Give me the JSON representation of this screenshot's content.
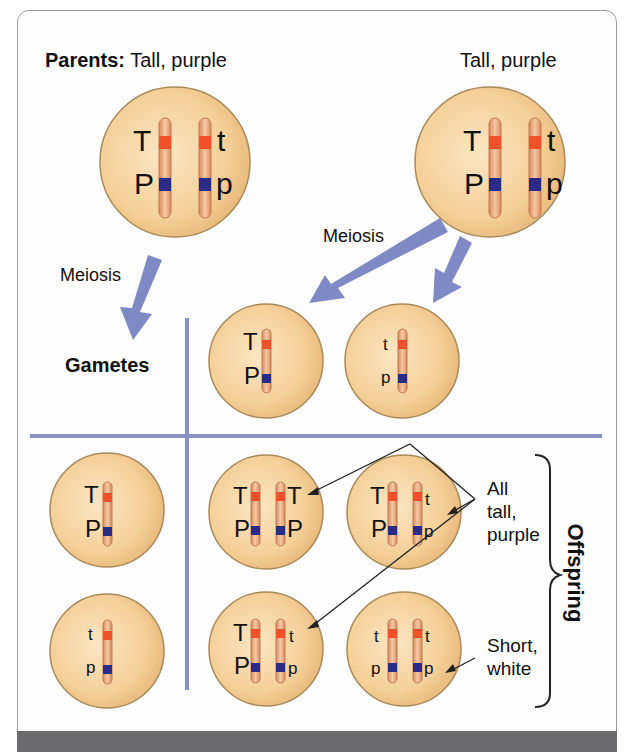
{
  "title": {
    "parents_bold": "Parents:",
    "parents_left": "Tall, purple",
    "parents_right": "Tall, purple"
  },
  "labels": {
    "meiosis_left": "Meiosis",
    "meiosis_right": "Meiosis",
    "gametes": "Gametes",
    "offspring": "Offspring",
    "all_tall_purple": [
      "All",
      "tall,",
      "purple"
    ],
    "short_white": [
      "Short,",
      "white"
    ]
  },
  "colors": {
    "cell_fill": "#f3cf96",
    "cell_edge": "#a98a5a",
    "chromosome": "#e9a677",
    "gene_T": "#f0502a",
    "gene_P": "#2b2a86",
    "arrow": "#7f8ac4",
    "grid_line": "#8890c4",
    "footer": "#6b6b6e"
  },
  "parents": [
    {
      "name": "parent-left",
      "alleles": [
        [
          "T",
          "P"
        ],
        [
          "t",
          "p"
        ]
      ],
      "phenotype": "Tall, purple"
    },
    {
      "name": "parent-right",
      "alleles": [
        [
          "T",
          "P"
        ],
        [
          "t",
          "p"
        ]
      ],
      "phenotype": "Tall, purple"
    }
  ],
  "gametes": {
    "top": [
      [
        "T",
        "P"
      ],
      [
        "t",
        "p"
      ]
    ],
    "left": [
      [
        "T",
        "P"
      ],
      [
        "t",
        "p"
      ]
    ]
  },
  "offspring": [
    {
      "row": 0,
      "col": 0,
      "alleles": [
        [
          "T",
          "P"
        ],
        [
          "T",
          "P"
        ]
      ],
      "phenotype": "tall, purple"
    },
    {
      "row": 0,
      "col": 1,
      "alleles": [
        [
          "T",
          "P"
        ],
        [
          "t",
          "p"
        ]
      ],
      "phenotype": "tall, purple"
    },
    {
      "row": 1,
      "col": 0,
      "alleles": [
        [
          "T",
          "P"
        ],
        [
          "t",
          "p"
        ]
      ],
      "phenotype": "tall, purple"
    },
    {
      "row": 1,
      "col": 1,
      "alleles": [
        [
          "t",
          "p"
        ],
        [
          "t",
          "p"
        ]
      ],
      "phenotype": "short, white"
    }
  ]
}
